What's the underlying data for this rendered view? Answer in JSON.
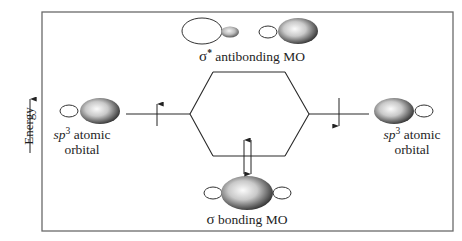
{
  "diagram": {
    "axis": {
      "label": "Energy",
      "direction": "up"
    },
    "labels": {
      "antibonding": {
        "symbol": "σ",
        "superscript": "*",
        "text": " antibonding MO"
      },
      "bonding": {
        "symbol": "σ",
        "text": " bonding MO"
      },
      "left_ao": {
        "italic": "sp",
        "superscript": "3",
        "line1_rest": " atomic",
        "line2": "orbital"
      },
      "right_ao": {
        "italic": "sp",
        "superscript": "3",
        "line1_rest": " atomic",
        "line2": "orbital"
      }
    },
    "levels": [
      {
        "name": "left-sp3",
        "electrons": [
          "up"
        ]
      },
      {
        "name": "right-sp3",
        "electrons": [
          "down"
        ]
      },
      {
        "name": "sigma-bonding",
        "electrons": [
          "up",
          "down"
        ]
      },
      {
        "name": "sigma-star-antibonding",
        "electrons": []
      }
    ],
    "colors": {
      "line": "#2a2a2a",
      "frame": "#6a6a6a",
      "lobe_light": "#f4f4f4",
      "lobe_dark": "#3c3c3c"
    }
  }
}
